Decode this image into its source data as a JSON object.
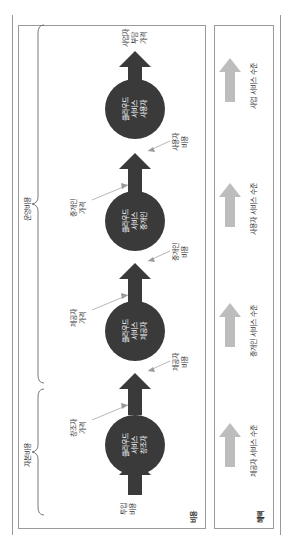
{
  "cost_box": {
    "title": "비용",
    "brace_capital": "자본비용",
    "brace_operating": "운영비용",
    "input_cost": [
      "투입",
      "비용"
    ],
    "final_price": [
      "사업자",
      "부담",
      "가격"
    ],
    "nodes": [
      {
        "lines": [
          "클라우드",
          "서비스",
          "창조자"
        ]
      },
      {
        "lines": [
          "클라우드",
          "서비스",
          "제공자"
        ]
      },
      {
        "lines": [
          "클라우드",
          "서비스",
          "중개인"
        ]
      },
      {
        "lines": [
          "클라우드",
          "서비스",
          "사용자"
        ]
      }
    ],
    "price_labels": [
      [
        "창조자",
        "가격"
      ],
      [
        "제공자",
        "가격"
      ],
      [
        "중개인",
        "가격"
      ]
    ],
    "cost_labels": [
      [
        "제공자",
        "비용"
      ],
      [
        "중개인",
        "비용"
      ],
      [
        "사용자",
        "비용"
      ]
    ]
  },
  "benefit_box": {
    "title": "혜택",
    "levels": [
      "제공자 서비스 수준",
      "중개인 서비스 수준",
      "사용자 서비스 수준",
      "사업 서비스 수준"
    ]
  },
  "colors": {
    "node_fill": "#3a3a3a",
    "arrow_dark": "#3a3a3a",
    "arrow_light": "#bdbdbd",
    "border": "#9a9a9a"
  }
}
